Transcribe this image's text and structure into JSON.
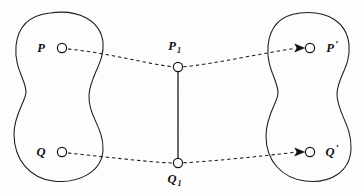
{
  "figure": {
    "type": "mathematical-diagram",
    "background_color": "#fdfdfc",
    "ink_color": "#1a1a1a",
    "labels": {
      "source_point_p": "P",
      "source_point_q": "Q",
      "intermediate_point_p1_base": "P",
      "intermediate_point_p1_sub": "1",
      "intermediate_point_q1_base": "Q",
      "intermediate_point_q1_sub": "1",
      "image_point_p_prime_base": "P",
      "image_point_p_prime_mark": "′",
      "image_point_q_prime_base": "Q",
      "image_point_q_prime_mark": "′"
    },
    "nodes": [
      {
        "name": "P",
        "x": 62,
        "y": 48,
        "r": 4.6,
        "label_side": "left"
      },
      {
        "name": "Q",
        "x": 62,
        "y": 152,
        "r": 4.6,
        "label_side": "left"
      },
      {
        "name": "P1",
        "x": 178,
        "y": 67,
        "r": 4.6,
        "label_side": "above"
      },
      {
        "name": "Q1",
        "x": 178,
        "y": 163,
        "r": 4.6,
        "label_side": "below"
      },
      {
        "name": "P'",
        "x": 310,
        "y": 48,
        "r": 4.6,
        "label_side": "right"
      },
      {
        "name": "Q'",
        "x": 310,
        "y": 152,
        "r": 4.6,
        "label_side": "right"
      }
    ],
    "connections": [
      {
        "from": "P",
        "to": "P1",
        "style": "dashed",
        "arrow": false
      },
      {
        "from": "P1",
        "to": "P'",
        "style": "dashed",
        "arrow": true
      },
      {
        "from": "Q",
        "to": "Q1",
        "style": "dashed",
        "arrow": false
      },
      {
        "from": "Q1",
        "to": "Q'",
        "style": "dashed",
        "arrow": true
      },
      {
        "from": "P1",
        "to": "Q1",
        "style": "solid",
        "arrow": false
      }
    ],
    "regions": [
      {
        "name": "left-region",
        "shape": "kidney",
        "center_x": 72,
        "center_y": 97
      },
      {
        "name": "right-region",
        "shape": "kidney",
        "center_x": 312,
        "center_y": 97
      }
    ]
  }
}
